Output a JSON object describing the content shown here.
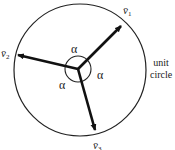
{
  "diagram": {
    "type": "vector-diagram",
    "caption": {
      "line1": "unit",
      "line2": "circle"
    },
    "vectors": [
      {
        "name": "v",
        "subscript": "1",
        "label": "v̄1"
      },
      {
        "name": "v",
        "subscript": "2",
        "label": "v̄2"
      },
      {
        "name": "v",
        "subscript": "3",
        "label": "v̄3"
      }
    ],
    "angles": [
      {
        "label": "α"
      },
      {
        "label": "α"
      },
      {
        "label": "α"
      }
    ],
    "colors": {
      "stroke": "#111111",
      "background": "#ffffff"
    }
  }
}
